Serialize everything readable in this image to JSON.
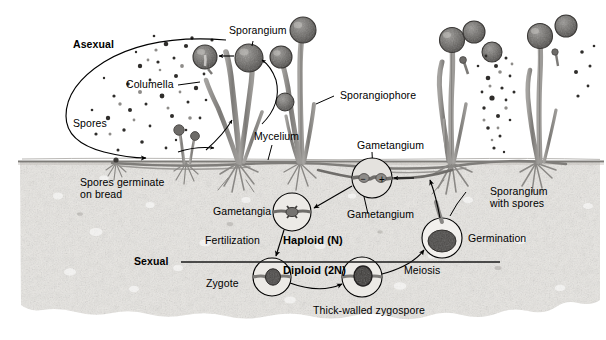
{
  "diagram": {
    "substrate": "bread",
    "colors": {
      "background": "#ffffff",
      "bread": "#e8e6e2",
      "bread_dark": "#d2cfca",
      "crust_line": "#8b8b86",
      "hypha": "#8d8b88",
      "hypha_dark": "#6f6d6a",
      "spore": "#3a3a3a",
      "ink": "#000000"
    },
    "cycles": [
      {
        "key": "asexual",
        "label": "Asexual"
      },
      {
        "key": "sexual",
        "label": "Sexual"
      }
    ],
    "ploidy": {
      "haploid": "Haploid (N)",
      "diploid": "Diploid (2N)"
    },
    "labels": {
      "asexual": "Asexual",
      "sexual": "Sexual",
      "sporangium": "Sporangium",
      "sporangiophore": "Sporangiophore",
      "columella": "Columella",
      "spores": "Spores",
      "spores_germinate": "Spores germinate\non bread",
      "mycelium": "Mycelium",
      "gametangium_top": "Gametangium",
      "gametangium_bottom": "Gametangium",
      "gametangia": "Gametangia",
      "fertilization": "Fertilization",
      "zygote": "Zygote",
      "thick_walled_zygospore": "Thick-walled zygospore",
      "meiosis": "Meiosis",
      "germination": "Germination",
      "sporangium_with_spores": "Sporangium\nwith spores",
      "plus_strain": "+",
      "minus_strain": "−"
    },
    "stages": [
      {
        "id": "spores",
        "name": "Spores",
        "phase": "asexual"
      },
      {
        "id": "germination-bread",
        "name": "Spores germinate on bread",
        "phase": "asexual"
      },
      {
        "id": "mycelium",
        "name": "Mycelium",
        "phase": "asexual"
      },
      {
        "id": "sporangiophore",
        "name": "Sporangiophore",
        "phase": "asexual"
      },
      {
        "id": "sporangium",
        "name": "Sporangium",
        "phase": "asexual"
      },
      {
        "id": "columella",
        "name": "Columella",
        "phase": "asexual"
      },
      {
        "id": "gametangia",
        "name": "Gametangia",
        "phase": "sexual"
      },
      {
        "id": "gametangium",
        "name": "Gametangium",
        "phase": "sexual"
      },
      {
        "id": "fertilization",
        "name": "Fertilization",
        "phase": "sexual"
      },
      {
        "id": "zygote",
        "name": "Zygote",
        "phase": "sexual"
      },
      {
        "id": "zygospore",
        "name": "Thick-walled zygospore",
        "phase": "sexual"
      },
      {
        "id": "meiosis",
        "name": "Meiosis",
        "phase": "sexual"
      },
      {
        "id": "germination",
        "name": "Germination",
        "phase": "sexual"
      },
      {
        "id": "sporangium-spores",
        "name": "Sporangium with spores",
        "phase": "sexual"
      }
    ]
  }
}
